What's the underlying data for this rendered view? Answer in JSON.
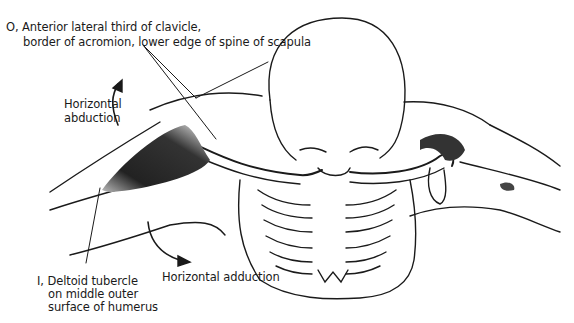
{
  "figure": {
    "labels": {
      "origin": {
        "prefix": "O,",
        "line1": "Anterior lateral third of clavicle,",
        "line2": "border of acromion, lower edge of spine of scapula"
      },
      "insertion": {
        "prefix": "I,",
        "line1": "Deltoid tubercle",
        "line2": "on middle outer",
        "line3": "surface of humerus"
      },
      "horizontal_abduction": {
        "line1": "Horizontal",
        "line2": "abduction"
      },
      "horizontal_adduction": "Horizontal adduction"
    },
    "colors": {
      "ink": "#1a1a1a",
      "muscle_shade": "#2b2b2b",
      "background": "#ffffff"
    }
  }
}
